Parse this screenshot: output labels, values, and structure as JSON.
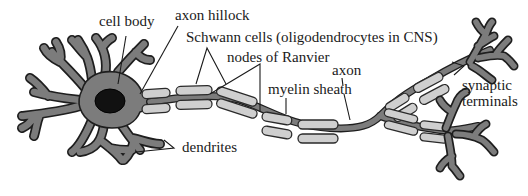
{
  "diagram": {
    "labels": {
      "cell_body": "cell body",
      "axon_hillock": "axon hillock",
      "schwann_cells": "Schwann cells (oligodendrocytes in CNS)",
      "nodes_of_ranvier": "nodes of Ranvier",
      "axon": "axon",
      "myelin_sheath": "myelin sheath",
      "synaptic_terminals_line1": "synaptic",
      "synaptic_terminals_line2": "terminals",
      "dendrites": "dendrites"
    },
    "colors": {
      "cell_fill": "#7c7c7c",
      "outline": "#1e1e1e",
      "myelin_fill": "#cfcfcf",
      "nucleus": "#111111",
      "text": "#1a1a1a",
      "background": "#ffffff"
    }
  }
}
